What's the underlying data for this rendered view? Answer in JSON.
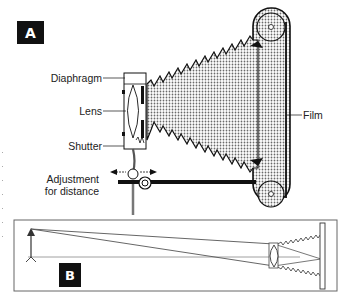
{
  "figure": {
    "panel_a": {
      "badge": "A",
      "labels": {
        "diaphragm": "Diaphragm",
        "lens": "Lens",
        "shutter": "Shutter",
        "adjustment_line1": "Adjustment",
        "adjustment_line2": "for distance",
        "film": "Film"
      }
    },
    "panel_b": {
      "badge": "B"
    },
    "colors": {
      "ink": "#111111",
      "stipple": "#9a9a9a",
      "line": "#555555",
      "background": "#ffffff"
    }
  }
}
